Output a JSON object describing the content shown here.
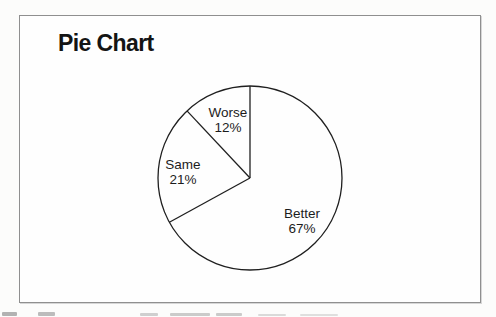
{
  "header": {
    "title": "Pie Chart"
  },
  "chart_data": {
    "type": "pie",
    "title": "Pie Chart",
    "order": "clockwise-from-12-oclock",
    "total": 100,
    "slices": [
      {
        "label": "Better",
        "value": 67,
        "pct_label": "67%",
        "label_pos": {
          "x": 282,
          "y": 205
        }
      },
      {
        "label": "Same",
        "value": 21,
        "pct_label": "21%",
        "label_pos": {
          "x": 163,
          "y": 156
        }
      },
      {
        "label": "Worse",
        "value": 12,
        "pct_label": "12%",
        "label_pos": {
          "x": 208,
          "y": 104
        }
      }
    ],
    "labels_inside": true,
    "legend": "none",
    "grid": "off",
    "geometry": {
      "cx": 230,
      "cy": 162,
      "r": 92
    },
    "colors": {
      "slice_fill": "#fefefe",
      "stroke": "#1f1f1f",
      "frame_border": "#8f8f8f",
      "title_color": "#141414",
      "label_color": "#1c1c1c"
    }
  },
  "artifacts": {
    "clipped_bottom_text": "illegible (letter tops cut off by image edge)",
    "fragments": [
      {
        "x": 2,
        "y": 312,
        "w": 15,
        "h": 4,
        "o": 0.75
      },
      {
        "x": 38,
        "y": 312,
        "w": 17,
        "h": 4,
        "o": 0.65
      },
      {
        "x": 140,
        "y": 313,
        "w": 18,
        "h": 3,
        "o": 0.45
      },
      {
        "x": 170,
        "y": 313,
        "w": 40,
        "h": 3,
        "o": 0.5
      },
      {
        "x": 216,
        "y": 313,
        "w": 26,
        "h": 3,
        "o": 0.5
      },
      {
        "x": 258,
        "y": 314,
        "w": 28,
        "h": 2,
        "o": 0.35
      },
      {
        "x": 300,
        "y": 314,
        "w": 38,
        "h": 2,
        "o": 0.3
      }
    ]
  }
}
